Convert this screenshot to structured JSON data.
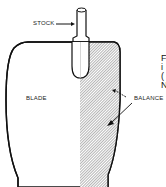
{
  "diagram": {
    "type": "rudder cross-section",
    "labels": {
      "stock": "STOCK",
      "blade": "BLADE",
      "balance": "BALANCE"
    },
    "edge_text": [
      "F",
      "i",
      "(",
      "N"
    ],
    "colors": {
      "outline": "#111111",
      "hatch": "#888888",
      "background": "#ffffff"
    }
  }
}
